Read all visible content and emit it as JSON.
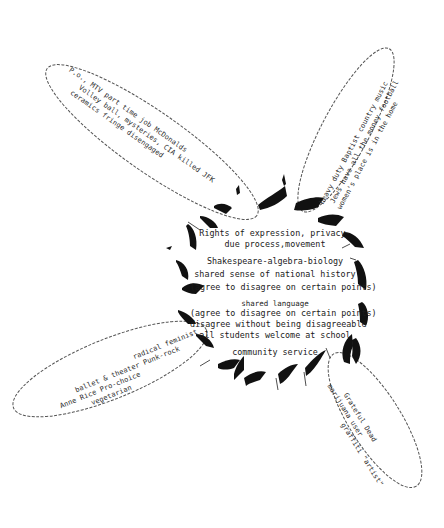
{
  "diagram": {
    "type": "core-and-petals",
    "core": {
      "blocks": [
        {
          "lines": [
            "Rights of expression, privacy-",
            "due process,movement"
          ]
        },
        {
          "lines": [
            "Shakespeare-algebra-biology",
            "shared sense of national history",
            "(agree to disagree on certain points)"
          ]
        },
        {
          "lines": [
            "shared language",
            "(agree to disagree on certain points)",
            "disagree without being disagreeable",
            "all students welcome at school"
          ]
        },
        {
          "lines": [
            "community service"
          ]
        }
      ]
    },
    "petals": {
      "top_left": {
        "lines": [
          "P.o., MTV    part time job McDonalds",
          "Volley ball, mysteries,    CIA killed JFK",
          "ceramics    fringe    disengaged"
        ]
      },
      "top_right": {
        "lines": [
          "heavy duty Baptist  country music",
          "Jews have all the money    football",
          "women's place is in the home"
        ]
      },
      "bottom_left": {
        "lines": [
          "radical feminist",
          "ballet & theater      Punk-rock",
          "Anne Rice           Pro-choice",
          "vegetarian"
        ]
      },
      "bottom_right": {
        "lines": [
          "Grateful Dead",
          "marijuana user",
          "graffiti \"artist\""
        ]
      }
    },
    "colors": {
      "ink": "#111111",
      "outline": "#555555",
      "background": "#ffffff"
    }
  }
}
